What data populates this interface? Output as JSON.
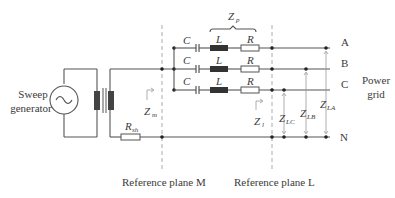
{
  "diagram": {
    "source": {
      "label_line1": "Sweep",
      "label_line2": "generator",
      "symbol": "ac-source-icon"
    },
    "shunt_resistor": {
      "label": "R",
      "sub": "sh"
    },
    "impedance_m": {
      "label": "Z",
      "sub": "m"
    },
    "impedance_l": {
      "label": "Z",
      "sub": "l"
    },
    "series_group": {
      "label": "Z",
      "sub": "p"
    },
    "branches": [
      {
        "c": "C",
        "l": "L",
        "r": "R",
        "phase": "A"
      },
      {
        "c": "C",
        "l": "L",
        "r": "R",
        "phase": "B"
      },
      {
        "c": "C",
        "l": "L",
        "r": "R",
        "phase": "C"
      }
    ],
    "neutral": "N",
    "grid": {
      "line1": "Power",
      "line2": "grid"
    },
    "loop_impedances": [
      {
        "label": "Z",
        "sub": "LC"
      },
      {
        "label": "Z",
        "sub": "LB"
      },
      {
        "label": "Z",
        "sub": "LA"
      }
    ],
    "planes": {
      "m": "Reference plane M",
      "l": "Reference plane L"
    }
  }
}
